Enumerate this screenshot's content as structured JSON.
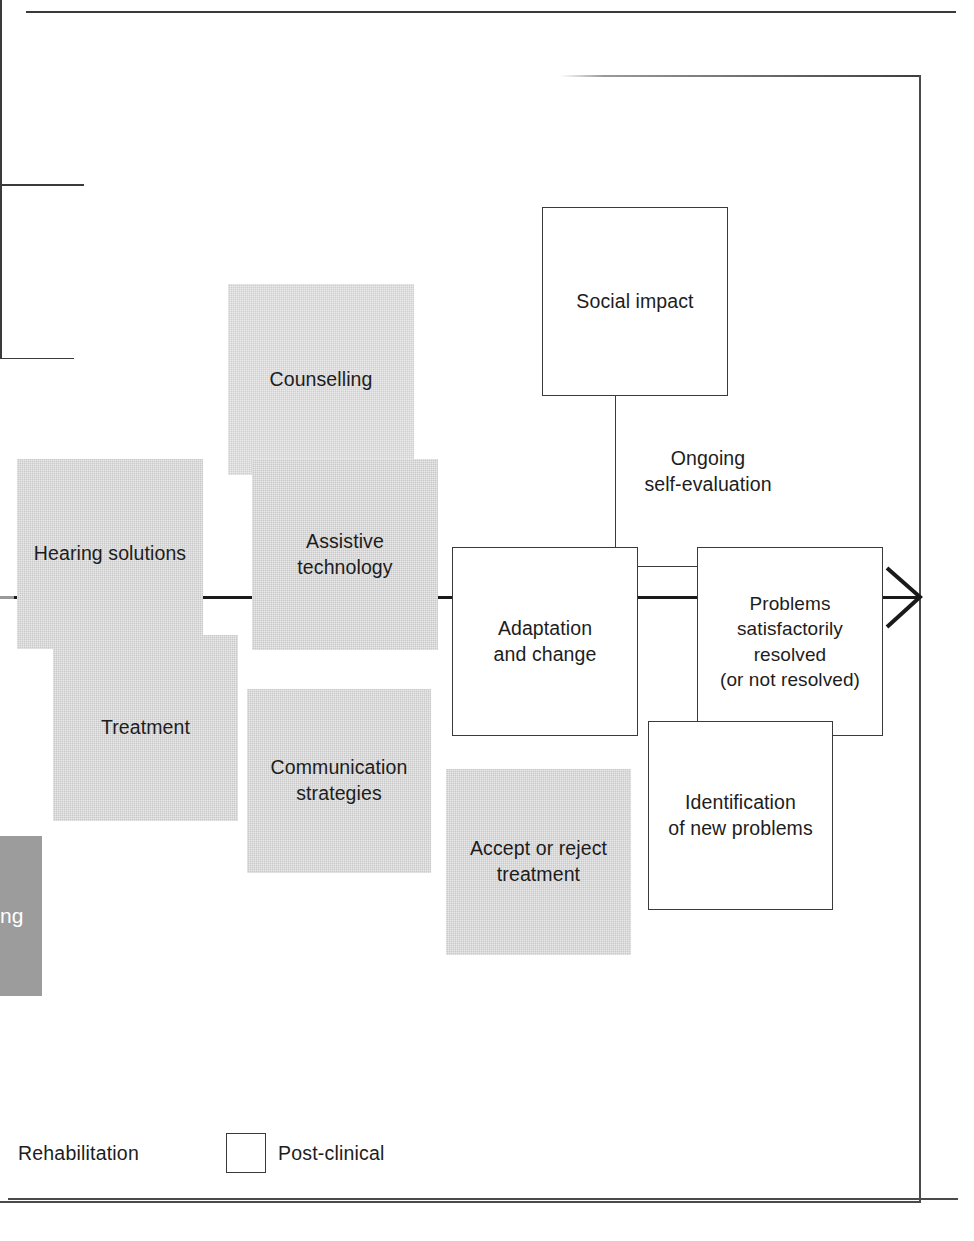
{
  "diagram": {
    "colors": {
      "gray_fill": "#c9c9c9",
      "gray_fill_light": "#cfcfcf",
      "dark_fill": "#9c9c9c",
      "white_fill": "#ffffff",
      "stroke": "#3a3a3a",
      "connector": "#1a1a1a",
      "text": "#1d1d1d"
    },
    "nodes": {
      "clipped_left": "ng",
      "hearing_solutions": "Hearing solutions",
      "treatment": "Treatment",
      "counselling": "Counselling",
      "assistive_technology": "Assistive\ntechnology",
      "communication_strategies": "Communication\nstrategies",
      "accept_or_reject": "Accept or reject\ntreatment",
      "social_impact": "Social impact",
      "ongoing_self_evaluation": "Ongoing\nself-evaluation",
      "adaptation_and_change": "Adaptation\nand change",
      "problems_resolved": "Problems\nsatisfactorily\nresolved\n(or not resolved)",
      "identification_new_problems": "Identification\nof new problems"
    },
    "legend": {
      "rehabilitation_label": "Rehabilitation",
      "post_clinical_label": "Post-clinical"
    }
  }
}
